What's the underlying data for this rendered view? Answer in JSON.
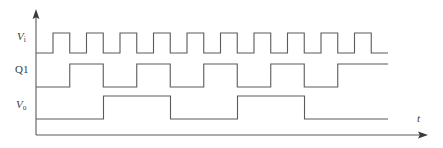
{
  "figure": {
    "kind": "digital-timing-waveform-diagram",
    "background_color": "#ffffff",
    "line_color": "#5a5a5a",
    "label_color": "#3a3a3a",
    "axis": {
      "x_axis_label": "t",
      "x_axis_label_style": "italic",
      "y_axis_label": "",
      "origin_x": 36,
      "baseline_y": 135,
      "y_axis_top": 12,
      "x_axis_end": 428,
      "arrowheads": [
        "up",
        "right"
      ]
    },
    "signals": [
      {
        "name": "Vi",
        "label_main": "V",
        "label_sub": "i",
        "label_italic": true,
        "row": 0,
        "low_y": 53,
        "high_y": 33,
        "start_x": 36,
        "end_x": 388,
        "first_edge_x": 53,
        "period_px": 33.5,
        "duty": 0.5,
        "pulse_count": 10,
        "starts_low": true,
        "ends_low": true,
        "description": "input clock square wave"
      },
      {
        "name": "Q1",
        "label_main": "Q1",
        "label_sub": "",
        "label_italic": false,
        "row": 1,
        "low_y": 87,
        "high_y": 64,
        "start_x": 36,
        "end_x": 388,
        "first_edge_x": 69.75,
        "period_px": 67,
        "duty": 0.5,
        "pulse_count": 5,
        "starts_low": true,
        "ends_low": false,
        "description": "divide-by-two of Vi"
      },
      {
        "name": "Vo",
        "label_main": "V",
        "label_sub": "o",
        "label_italic": true,
        "row": 2,
        "low_y": 119,
        "high_y": 96,
        "start_x": 36,
        "end_x": 388,
        "first_edge_x": 103.5,
        "period_px": 134,
        "duty": 0.5,
        "pulse_count": 2,
        "starts_low": true,
        "ends_low": true,
        "description": "divide-by-four output"
      }
    ]
  },
  "chart_data": {
    "type": "line",
    "title": "",
    "xlabel": "t",
    "ylabel": "",
    "grid": false,
    "legend": "none",
    "series": [
      {
        "name": "Vi",
        "transition_times_px": [
          53,
          69.75,
          86.5,
          103.5,
          120.25,
          137,
          154,
          170.75,
          187.5,
          204.5,
          221.25,
          238,
          255,
          271.75,
          288.5,
          305.5,
          322.25,
          339,
          356,
          372.75
        ],
        "levels": "starts low, alternates high/low at each transition, ends low",
        "pulse_count": 10
      },
      {
        "name": "Q1",
        "transition_times_px": [
          69.75,
          103.5,
          137,
          170.75,
          204.5,
          238,
          271.75,
          305.5,
          339,
          372.75
        ],
        "levels": "starts low, alternates, ends high",
        "pulse_count": 5
      },
      {
        "name": "Vo",
        "transition_times_px": [
          103.5,
          170.75,
          238,
          305.5,
          372.75
        ],
        "levels": "starts low, alternates, ends low",
        "pulse_count": 2
      }
    ]
  }
}
